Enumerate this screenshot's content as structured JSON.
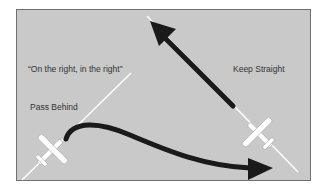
{
  "diagram": {
    "labels": {
      "quote": "“On the right, in the right”",
      "pass_behind": "Pass Behind",
      "keep_straight": "Keep Straight"
    },
    "colors": {
      "background": "#c9c9c9",
      "border": "#707070",
      "arrow": "#1a1a1a",
      "track_line": "#ffffff",
      "aircraft": "#ffffff",
      "text": "#333333"
    },
    "elements": [
      {
        "type": "aircraft",
        "position": "bottom-left",
        "heading": "northeast"
      },
      {
        "type": "aircraft",
        "position": "bottom-right",
        "heading": "northwest"
      },
      {
        "type": "arrow",
        "style": "curved",
        "meaning": "pass behind"
      },
      {
        "type": "arrow",
        "style": "straight",
        "meaning": "keep straight"
      }
    ]
  }
}
